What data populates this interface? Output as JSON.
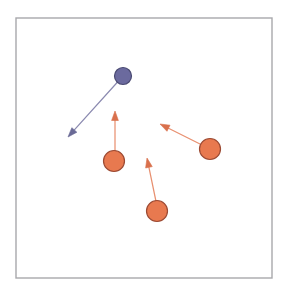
{
  "figure": {
    "title": "",
    "background_color": "#ffffff",
    "width": 285,
    "height": 290
  },
  "frame": {
    "name": "plot-border",
    "x": 16,
    "y": 18,
    "width": 256,
    "height": 260,
    "stroke_color": "#a8a8ac",
    "stroke_width": 1.4,
    "fill": "none"
  },
  "palette": {
    "blue_fill": "#6b6a9e",
    "blue_stroke": "#4a4a72",
    "blue_arrow": "#8b8ab0",
    "orange_fill": "#e8794f",
    "orange_stroke": "#9c4a33",
    "orange_arrow": "#e89070"
  },
  "chart_data": {
    "type": "scatter",
    "title": "",
    "xlabel": "",
    "ylabel": "",
    "xlim": [
      16,
      272
    ],
    "ylim": [
      18,
      278
    ],
    "grid": false,
    "legend": "none",
    "agents": [
      {
        "id": "agent-1",
        "label": "blue-agent",
        "group": "blue",
        "cx": 123,
        "cy": 76,
        "r": 8.5,
        "fill": "#6b6a9e",
        "stroke": "#4a4a72",
        "arrow": {
          "from_x": 123,
          "from_y": 76,
          "to_x": 68,
          "to_y": 137,
          "dx": -55,
          "dy": 61,
          "color": "#8b8ab0",
          "head_color": "#6a6a96"
        }
      },
      {
        "id": "agent-2",
        "label": "orange-agent-left",
        "group": "orange",
        "cx": 114,
        "cy": 161,
        "r": 10.5,
        "fill": "#e8794f",
        "stroke": "#9c4a33",
        "arrow": {
          "from_x": 115,
          "from_y": 161,
          "to_x": 115,
          "to_y": 111,
          "dx": 0,
          "dy": -50,
          "color": "#e89070",
          "head_color": "#d9704c"
        }
      },
      {
        "id": "agent-3",
        "label": "orange-agent-bottom",
        "group": "orange",
        "cx": 157,
        "cy": 211,
        "r": 10.5,
        "fill": "#e8794f",
        "stroke": "#9c4a33",
        "arrow": {
          "from_x": 158,
          "from_y": 211,
          "to_x": 147,
          "to_y": 158,
          "dx": -11,
          "dy": -53,
          "color": "#e89070",
          "head_color": "#d9704c"
        }
      },
      {
        "id": "agent-4",
        "label": "orange-agent-right",
        "group": "orange",
        "cx": 210,
        "cy": 149,
        "r": 10.5,
        "fill": "#e8794f",
        "stroke": "#9c4a33",
        "arrow": {
          "from_x": 210,
          "from_y": 149,
          "to_x": 160,
          "to_y": 124,
          "dx": -50,
          "dy": -25,
          "color": "#e89070",
          "head_color": "#d9704c"
        }
      }
    ]
  }
}
